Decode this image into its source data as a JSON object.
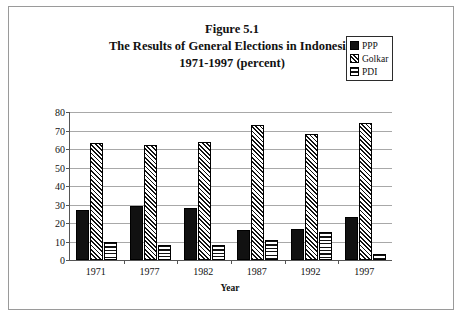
{
  "figure": {
    "title_lines": [
      "Figure 5.1",
      "The Results of General Elections in Indonesia,",
      "1971-1997 (percent)"
    ]
  },
  "legend": {
    "items": [
      {
        "label": "PPP",
        "pattern": "solid-black"
      },
      {
        "label": "Golkar",
        "pattern": "diagonal-hatch"
      },
      {
        "label": "PDI",
        "pattern": "horizontal-lines"
      }
    ]
  },
  "axes": {
    "y_title": "Percent",
    "x_title": "Year",
    "y_ticks": [
      "80",
      "70",
      "60",
      "50",
      "40",
      "30",
      "20",
      "10",
      "0"
    ]
  },
  "chart_data": {
    "type": "bar",
    "title": "Figure 5.1 The Results of General Elections in Indonesia, 1971-1997 (percent)",
    "xlabel": "Year",
    "ylabel": "Percent",
    "ylim": [
      0,
      80
    ],
    "ytick_step": 10,
    "grid": true,
    "legend_position": "top-right",
    "categories": [
      "1971",
      "1977",
      "1982",
      "1987",
      "1992",
      "1997"
    ],
    "series": [
      {
        "name": "PPP",
        "values": [
          27,
          29,
          28,
          16,
          17,
          23
        ]
      },
      {
        "name": "Golkar",
        "values": [
          63,
          62,
          64,
          73,
          68,
          74
        ]
      },
      {
        "name": "PDI",
        "values": [
          10,
          8,
          8,
          11,
          15,
          3
        ]
      }
    ]
  }
}
